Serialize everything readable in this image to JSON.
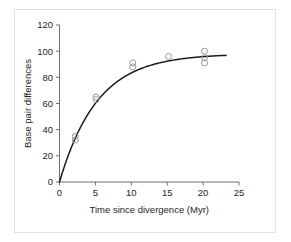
{
  "chart_data": {
    "type": "scatter",
    "title": "",
    "xlabel": "Time since divergence (Myr)",
    "ylabel": "Base pair differences",
    "xlim": [
      0,
      25
    ],
    "ylim": [
      0,
      120
    ],
    "xticks": [
      0,
      5,
      10,
      15,
      20,
      25
    ],
    "yticks": [
      0,
      20,
      40,
      60,
      80,
      100,
      120
    ],
    "xtick_labels": [
      "0",
      "5",
      "10",
      "15",
      "20",
      "25"
    ],
    "ytick_labels": [
      "0",
      "20",
      "40",
      "60",
      "80",
      "100",
      "120"
    ],
    "grid": false,
    "legend": false,
    "marker": "open-circle",
    "points": [
      {
        "x": 2.2,
        "y": 35
      },
      {
        "x": 2.2,
        "y": 32
      },
      {
        "x": 5.1,
        "y": 65
      },
      {
        "x": 5.1,
        "y": 63
      },
      {
        "x": 10.2,
        "y": 91
      },
      {
        "x": 10.2,
        "y": 88
      },
      {
        "x": 15.2,
        "y": 96
      },
      {
        "x": 20.2,
        "y": 100
      },
      {
        "x": 20.2,
        "y": 95
      },
      {
        "x": 20.2,
        "y": 91
      }
    ],
    "fit_curve": {
      "kind": "saturating-exponential",
      "description": "Base pair differences rise steeply then plateau near the asymptote",
      "asymptote": 98,
      "rate": 0.19,
      "x_start": 0,
      "x_end": 23.2
    }
  },
  "axes": {
    "y_axis_name": "y-axis",
    "x_axis_name": "x-axis"
  }
}
